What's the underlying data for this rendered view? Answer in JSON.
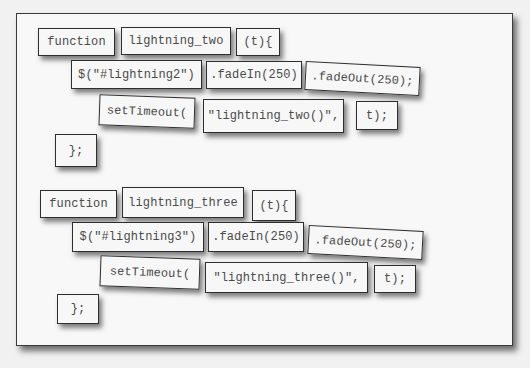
{
  "blocks": [
    {
      "row1": [
        "function",
        "lightning_two",
        "(t){"
      ],
      "row2": [
        "$(\"#lightning2\")",
        ".fadeIn(250)",
        ".fadeOut(250);"
      ],
      "row3": [
        "setTimeout(",
        "\"lightning_two()\",",
        "t);"
      ],
      "row4": [
        "};"
      ]
    },
    {
      "row1": [
        "function",
        "lightning_three",
        "(t){"
      ],
      "row2": [
        "$(\"#lightning3\")",
        ".fadeIn(250)",
        ".fadeOut(250);"
      ],
      "row3": [
        "setTimeout(",
        "\"lightning_three()\",",
        "t);"
      ],
      "row4": [
        "};"
      ]
    }
  ]
}
